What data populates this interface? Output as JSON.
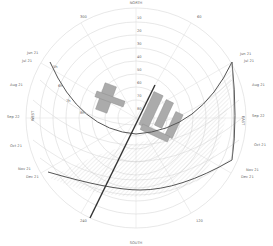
{
  "diagram": {
    "compass": {
      "north": "NORTH",
      "south": "SOUTH",
      "east": "EAST",
      "west": "WEST"
    },
    "azimuth_labels": [
      "300",
      "60",
      "120",
      "240"
    ],
    "altitude_labels": [
      "10",
      "20",
      "30",
      "40",
      "50",
      "60",
      "70",
      "80"
    ],
    "left_dates": [
      "Jun 21",
      "Jul 21",
      "Aug 21",
      "Sep 22",
      "Oct 21",
      "Nov 21",
      "Dec 21"
    ],
    "right_dates": [
      "Jun 21",
      "Jul 21",
      "Aug 21",
      "Sep 22",
      "Oct 21",
      "Nov 21",
      "Dec 21"
    ],
    "left_dates_alt": [
      "May 21",
      "Apr 21",
      "Mar 21",
      "Feb 21",
      "Jan 21"
    ],
    "hour_labels": [
      "5h",
      "6h",
      "7h",
      "8h"
    ],
    "colors": {
      "grid": "#cfcfcf",
      "path": "#555555",
      "building": "#a8a8a8",
      "hatch": "#bdbdbd",
      "text": "#666666"
    }
  }
}
